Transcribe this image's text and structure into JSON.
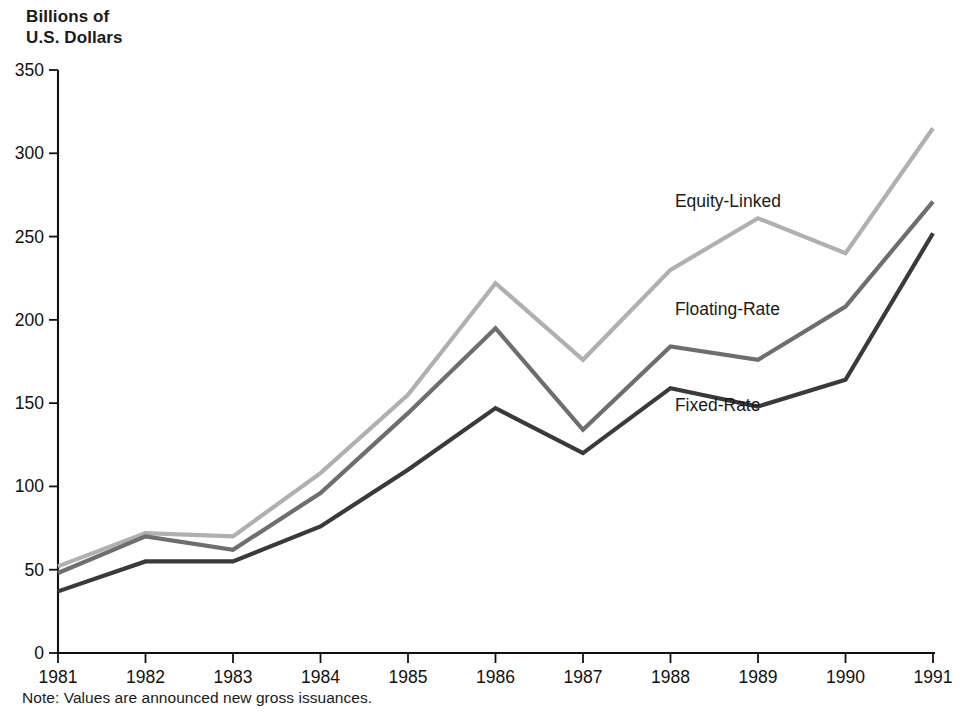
{
  "figure": {
    "axis_title": "Billions of\nU.S. Dollars",
    "note": "Note: Values are announced new gross issuances."
  },
  "labels": {
    "equity_linked": "Equity-Linked",
    "floating_rate": "Floating-Rate",
    "fixed_rate": "Fixed-Rate"
  },
  "colors": {
    "equity_linked": "#b0b0b0",
    "floating_rate": "#6e6e6e",
    "fixed_rate": "#3a3a3a",
    "axis": "#111111",
    "background": "#ffffff"
  },
  "chart_data": {
    "type": "line",
    "title": "Billions of U.S. Dollars",
    "xlabel": "",
    "ylabel": "Billions of U.S. Dollars",
    "note": "Note: Values are announced new gross issuances.",
    "grid": false,
    "legend_position": "inline-annotations",
    "x": [
      1981,
      1982,
      1983,
      1984,
      1985,
      1986,
      1987,
      1988,
      1989,
      1990,
      1991
    ],
    "xticklabels": [
      "1981",
      "1982",
      "1983",
      "1984",
      "1985",
      "1986",
      "1987",
      "1988",
      "1989",
      "1990",
      "1991"
    ],
    "yticks": [
      0,
      50,
      100,
      150,
      200,
      250,
      300,
      350
    ],
    "yticklabels": [
      "0",
      "50",
      "100",
      "150",
      "200",
      "250",
      "300",
      "350"
    ],
    "ylim": [
      0,
      350
    ],
    "xlim": [
      1981,
      1991
    ],
    "series": [
      {
        "name": "Equity-Linked",
        "color": "#b0b0b0",
        "values": [
          52,
          72,
          70,
          108,
          155,
          222,
          176,
          230,
          261,
          240,
          315
        ]
      },
      {
        "name": "Floating-Rate",
        "color": "#6e6e6e",
        "values": [
          48,
          70,
          62,
          96,
          144,
          195,
          134,
          184,
          176,
          208,
          271
        ]
      },
      {
        "name": "Fixed-Rate",
        "color": "#3a3a3a",
        "values": [
          37,
          55,
          55,
          76,
          110,
          147,
          120,
          159,
          148,
          164,
          252
        ]
      }
    ],
    "annotations": [
      {
        "text": "Equity-Linked",
        "x": 1988.05,
        "y": 268
      },
      {
        "text": "Floating-Rate",
        "x": 1988.05,
        "y": 203
      },
      {
        "text": "Fixed-Rate",
        "x": 1988.05,
        "y": 145
      }
    ]
  }
}
